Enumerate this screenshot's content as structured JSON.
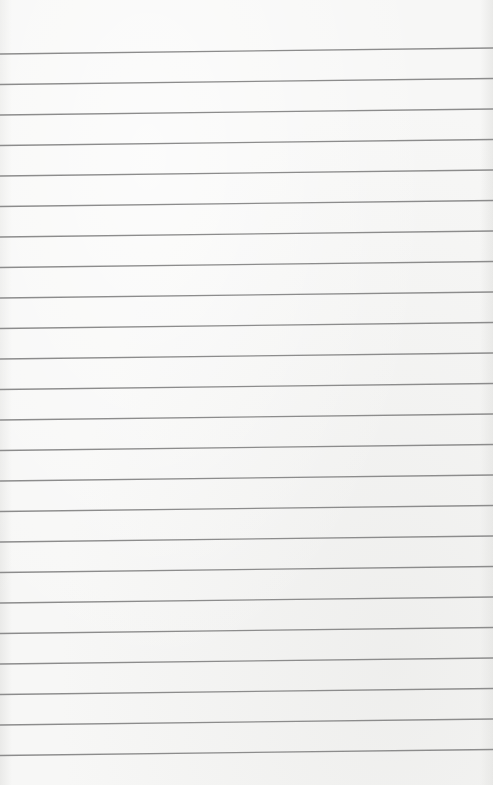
{
  "page": {
    "type": "ruled-paper",
    "paper_color": "#f7f7f6",
    "line_color": "#8c8c8c",
    "line_count": 24,
    "first_line_y_left": 54,
    "first_line_y_right": 48,
    "line_spacing": 30.5,
    "line_thickness": 1.3
  }
}
